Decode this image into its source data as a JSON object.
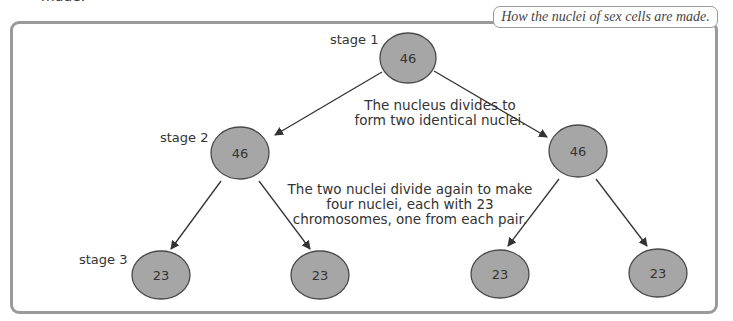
{
  "page": {
    "clipped_text": "made."
  },
  "figure": {
    "title": "How the nuclei of sex cells are made."
  },
  "stages": [
    {
      "label": "stage 1"
    },
    {
      "label": "stage 2"
    },
    {
      "label": "stage 3"
    }
  ],
  "captions": {
    "division_1": [
      "The nucleus divides to",
      "form two identical nuclei."
    ],
    "division_2": [
      "The two nuclei divide again to make",
      "four nuclei, each with 23",
      "chromosomes, one from each pair."
    ]
  },
  "nodes": {
    "stage1": [
      {
        "value": "46"
      }
    ],
    "stage2": [
      {
        "value": "46"
      },
      {
        "value": "46"
      }
    ],
    "stage3": [
      {
        "value": "23"
      },
      {
        "value": "23"
      },
      {
        "value": "23"
      },
      {
        "value": "23"
      }
    ]
  },
  "colors": {
    "node_fill": "#a6a6a6",
    "node_stroke": "#4a4a4a",
    "frame": "#9a9a9a",
    "arrow": "#333333"
  }
}
